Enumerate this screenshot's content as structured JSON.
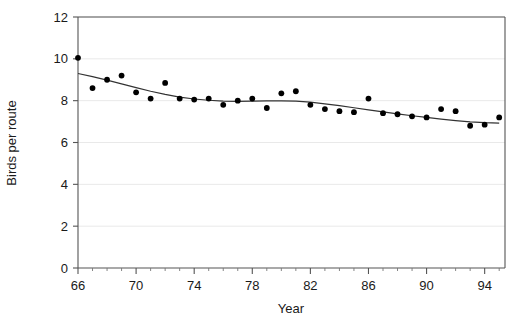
{
  "chart_data": {
    "type": "scatter",
    "title": "",
    "xlabel": "Year",
    "ylabel": "Birds per route",
    "xlim": [
      66,
      95.4
    ],
    "ylim": [
      0,
      12
    ],
    "grid": true,
    "legend": null,
    "x_tick_labels": [
      "66",
      "70",
      "74",
      "78",
      "82",
      "86",
      "90",
      "94"
    ],
    "x_tick_values": [
      66,
      70,
      74,
      78,
      82,
      86,
      90,
      94
    ],
    "x_minor_step": 1,
    "y_tick_labels": [
      "0",
      "2",
      "4",
      "6",
      "8",
      "10",
      "12"
    ],
    "y_tick_values": [
      0,
      2,
      4,
      6,
      8,
      10,
      12
    ],
    "x": [
      66,
      67,
      68,
      69,
      70,
      71,
      72,
      73,
      74,
      75,
      76,
      77,
      78,
      79,
      80,
      81,
      82,
      83,
      84,
      85,
      86,
      87,
      88,
      89,
      90,
      91,
      92,
      93,
      94,
      95
    ],
    "values": [
      10.05,
      8.6,
      9.0,
      9.2,
      8.4,
      8.1,
      8.85,
      8.1,
      8.05,
      8.1,
      7.8,
      8.0,
      8.1,
      7.65,
      8.35,
      8.45,
      7.8,
      7.6,
      7.5,
      7.45,
      8.1,
      7.4,
      7.35,
      7.25,
      7.2,
      7.6,
      7.5,
      6.8,
      6.85,
      7.2
    ],
    "series": [
      {
        "name": "Birds per route",
        "marker": "filled-circle",
        "color": "#000000",
        "values": [
          10.05,
          8.6,
          9.0,
          9.2,
          8.4,
          8.1,
          8.85,
          8.1,
          8.05,
          8.1,
          7.8,
          8.0,
          8.1,
          7.65,
          8.35,
          8.45,
          7.8,
          7.6,
          7.5,
          7.45,
          8.1,
          7.4,
          7.35,
          7.25,
          7.2,
          7.6,
          7.5,
          6.8,
          6.85,
          7.2
        ]
      }
    ],
    "trend_line": {
      "name": "smoothed trend",
      "color": "#333333",
      "x": [
        66,
        67,
        68,
        69,
        70,
        71,
        72,
        73,
        74,
        75,
        76,
        77,
        78,
        79,
        80,
        81,
        82,
        83,
        84,
        85,
        86,
        87,
        88,
        89,
        90,
        91,
        92,
        93,
        94,
        95
      ],
      "values": [
        9.3,
        9.15,
        8.98,
        8.8,
        8.62,
        8.45,
        8.3,
        8.17,
        8.08,
        8.02,
        7.98,
        7.97,
        7.98,
        7.99,
        7.99,
        7.98,
        7.93,
        7.85,
        7.76,
        7.66,
        7.56,
        7.46,
        7.37,
        7.28,
        7.2,
        7.12,
        7.05,
        6.99,
        6.95,
        6.93
      ]
    }
  }
}
